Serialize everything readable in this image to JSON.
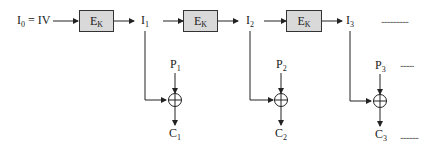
{
  "diagram": {
    "type": "block-cipher-mode (OFB-style) encryption chain",
    "initial": {
      "base": "I",
      "sub": "0",
      "suffix": " = IV"
    },
    "encrypt_blocks": [
      {
        "base": "E",
        "sub": "K"
      },
      {
        "base": "E",
        "sub": "K"
      },
      {
        "base": "E",
        "sub": "K"
      }
    ],
    "intermediates": [
      {
        "base": "I",
        "sub": "1"
      },
      {
        "base": "I",
        "sub": "2"
      },
      {
        "base": "I",
        "sub": "3"
      }
    ],
    "plaintexts": [
      {
        "base": "P",
        "sub": "1"
      },
      {
        "base": "P",
        "sub": "2"
      },
      {
        "base": "P",
        "sub": "3"
      }
    ],
    "ciphertexts": [
      {
        "base": "C",
        "sub": "1"
      },
      {
        "base": "C",
        "sub": "2"
      },
      {
        "base": "C",
        "sub": "3"
      }
    ],
    "xor_symbol": "⊕",
    "continuation": "..................",
    "continuation_short": ".........",
    "continuation_c": "............",
    "colors": {
      "box_fill": "#d9d9d9",
      "line": "#222222"
    }
  }
}
